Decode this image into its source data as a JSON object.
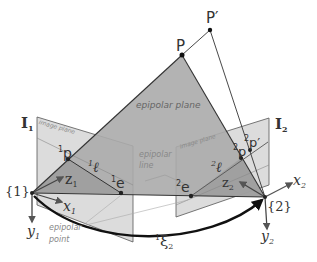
{
  "diagram": {
    "colors": {
      "image_plane_fill": "#d9d9d9",
      "epipolar_plane_fill": "#a9a9a9",
      "line": "#333333",
      "axis": "#555555",
      "annotation": "#888888",
      "background": "#ffffff"
    },
    "points": {
      "P": "P",
      "P_prime": "P′",
      "p1": {
        "pre": "1",
        "base": "p"
      },
      "p2": {
        "pre": "2",
        "base": "p"
      },
      "p2_prime": {
        "pre": "2",
        "base": "p′"
      },
      "e1": {
        "pre": "1",
        "base": "e"
      },
      "e2": {
        "pre": "2",
        "base": "e"
      }
    },
    "lines": {
      "l1": {
        "pre": "1",
        "base": "ℓ"
      },
      "l2": {
        "pre": "2",
        "base": "ℓ"
      }
    },
    "planes": {
      "epipolar_plane": "epipolar plane",
      "image_plane_1": "image plane",
      "image_plane_2": "image plane",
      "I1": {
        "base": "I",
        "sub": "1"
      },
      "I2": {
        "base": "I",
        "sub": "2"
      }
    },
    "frames": {
      "frame1": "{1}",
      "frame2": "{2}",
      "x1": {
        "base": "x",
        "sub": "1"
      },
      "y1": {
        "base": "y",
        "sub": "1"
      },
      "z1": {
        "base": "z",
        "sub": "1"
      },
      "x2": {
        "base": "x",
        "sub": "2"
      },
      "y2": {
        "base": "y",
        "sub": "2"
      },
      "z2": {
        "base": "z",
        "sub": "2"
      }
    },
    "transform": {
      "pre": "1",
      "base": "ξ",
      "sub": "2"
    },
    "annotations": {
      "epipolar_line": [
        "epipolar",
        "line"
      ],
      "epipolar_point": [
        "epipolar",
        "point"
      ]
    }
  }
}
